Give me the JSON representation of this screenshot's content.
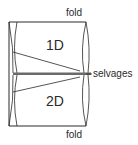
{
  "diagram": {
    "labels": {
      "fold_top": "fold",
      "fold_bottom": "fold",
      "selvages": "selvages",
      "panel_top": "1D",
      "panel_bottom": "2D"
    },
    "colors": {
      "line": "#2a2a2a",
      "selvage_band": "#6a6a6a",
      "background": "#ffffff"
    }
  }
}
